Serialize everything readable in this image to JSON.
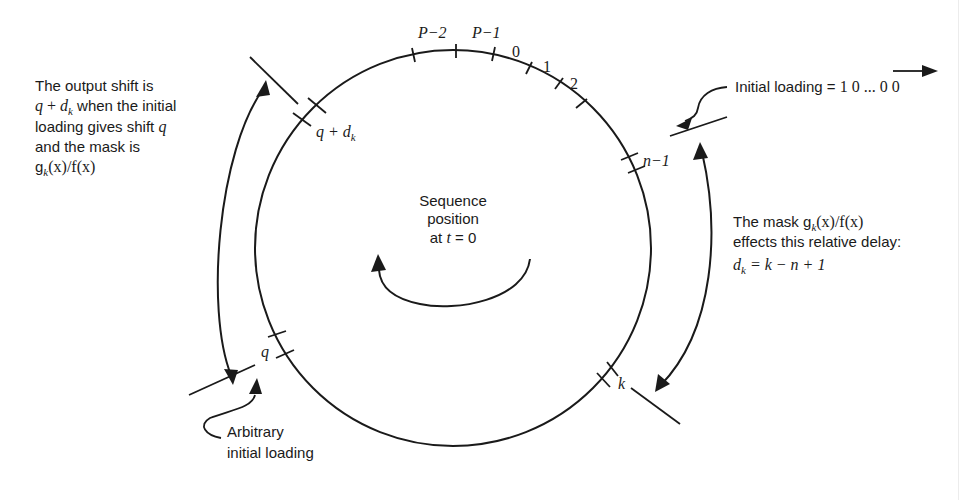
{
  "diagram": {
    "type": "circular-sequence-diagram",
    "center_label": {
      "line1": "Sequence",
      "line2": "position",
      "line3_prefix": "at ",
      "line3_var": "t",
      "line3_suffix": " = 0"
    },
    "top_ticks": {
      "p_minus_2": "P−2",
      "p_minus_1": "P−1",
      "zero": "0",
      "one": "1",
      "two": "2"
    },
    "markers": {
      "q_plus_dk": {
        "q": "q",
        "plus": " + ",
        "d": "d",
        "sub": "k"
      },
      "n_minus_1": "n−1",
      "k": "k",
      "q": "q"
    },
    "annotations": {
      "output_shift": {
        "line1": "The output shift is",
        "line2_q": "q",
        "line2_plus": " + ",
        "line2_d": "d",
        "line2_sub": "k",
        "line2_rest": " when the initial",
        "line3_text": "loading gives  shift  ",
        "line3_q": "q",
        "line4": "and the mask is",
        "line5_g": "g",
        "line5_sub": "k",
        "line5_rest": "(x)/f(x)"
      },
      "initial_loading": {
        "text": "Initial loading = ",
        "value": "1 0 ... 0 0"
      },
      "mask_delay": {
        "line1_text": "The mask g",
        "line1_sub": "k",
        "line1_rest": "(x)/f(x)",
        "line2": "effects this relative delay:",
        "line3_d": "d",
        "line3_sub": "k",
        "line3_rest": " = k − n + 1"
      },
      "arbitrary_loading": {
        "line1": "Arbitrary",
        "line2": "initial  loading"
      }
    },
    "colors": {
      "ink": "#1a1a1a",
      "background": "#ffffff"
    }
  }
}
